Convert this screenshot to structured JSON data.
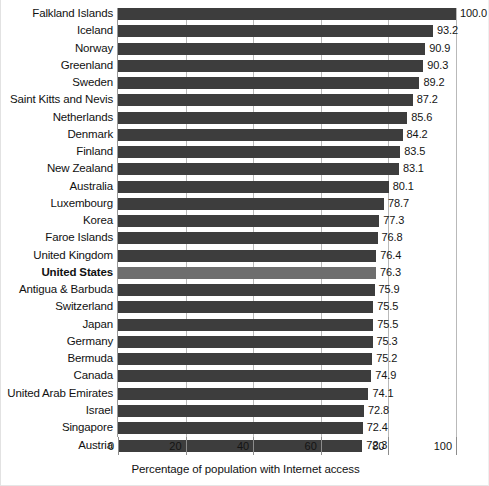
{
  "chart_data": {
    "type": "bar",
    "orientation": "horizontal",
    "title": "",
    "subtitle": "",
    "xlabel": "Percentage of population with Internet access",
    "ylabel": "",
    "xlim": [
      0,
      100
    ],
    "xticks": [
      0,
      20,
      40,
      60,
      80,
      100
    ],
    "xtick_labels": [
      "0",
      "20",
      "40",
      "60",
      "80",
      "100"
    ],
    "grid": true,
    "grid_axis": "x",
    "legend": false,
    "legend_position": "none",
    "bar_color": "#3d3d3d",
    "highlight_color": "#6e6e6e",
    "highlight_category": "United States",
    "categories": [
      "Falkland Islands",
      "Iceland",
      "Norway",
      "Greenland",
      "Sweden",
      "Saint Kitts and Nevis",
      "Netherlands",
      "Denmark",
      "Finland",
      "New Zealand",
      "Australia",
      "Luxembourg",
      "Korea",
      "Faroe Islands",
      "United Kingdom",
      "United States",
      "Antigua & Barbuda",
      "Switzerland",
      "Japan",
      "Germany",
      "Bermuda",
      "Canada",
      "United Arab Emirates",
      "Israel",
      "Singapore",
      "Austria"
    ],
    "values": [
      100.0,
      93.2,
      90.9,
      90.3,
      89.2,
      87.2,
      85.6,
      84.2,
      83.5,
      83.1,
      80.1,
      78.7,
      77.3,
      76.8,
      76.4,
      76.3,
      75.9,
      75.5,
      75.5,
      75.3,
      75.2,
      74.9,
      74.1,
      72.8,
      72.4,
      72.3
    ],
    "value_labels": [
      "100.0",
      "93.2",
      "90.9",
      "90.3",
      "89.2",
      "87.2",
      "85.6",
      "84.2",
      "83.5",
      "83.1",
      "80.1",
      "78.7",
      "77.3",
      "76.8",
      "76.4",
      "76.3",
      "75.9",
      "75.5",
      "75.5",
      "75.3",
      "75.2",
      "74.9",
      "74.1",
      "72.8",
      "72.4",
      "72.3"
    ]
  }
}
